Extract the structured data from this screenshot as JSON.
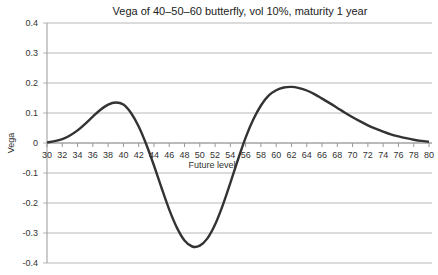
{
  "chart_data": {
    "type": "line",
    "title": "Vega of 40–50–60 butterfly, vol 10%, maturity 1 year",
    "xlabel": "Future level",
    "ylabel": "Vega",
    "xlim": [
      30,
      80
    ],
    "ylim": [
      -0.4,
      0.4
    ],
    "grid": true,
    "legend": "none",
    "x_ticks": [
      30,
      32,
      34,
      36,
      38,
      40,
      42,
      44,
      46,
      48,
      50,
      52,
      54,
      56,
      58,
      60,
      62,
      64,
      66,
      68,
      70,
      72,
      74,
      76,
      78,
      80
    ],
    "y_ticks": [
      0.4,
      0.3,
      0.2,
      0.1,
      0,
      -0.1,
      -0.2,
      -0.3,
      -0.4
    ],
    "y_tick_labels": [
      "0.4",
      "0.3",
      "0.2",
      "0.1",
      "0",
      "-0.1",
      "-0.2",
      "-0.3",
      "-0.4"
    ],
    "series": [
      {
        "name": "Vega",
        "color": "#333333",
        "x": [
          30,
          31,
          32,
          33,
          34,
          35,
          36,
          37,
          38,
          39,
          40,
          41,
          42,
          43,
          44,
          45,
          46,
          47,
          48,
          49,
          50,
          51,
          52,
          53,
          54,
          55,
          56,
          57,
          58,
          59,
          60,
          61,
          62,
          63,
          64,
          65,
          66,
          67,
          68,
          69,
          70,
          71,
          72,
          73,
          74,
          75,
          76,
          77,
          78,
          79,
          80
        ],
        "values": [
          0.002,
          0.006,
          0.013,
          0.025,
          0.042,
          0.064,
          0.088,
          0.111,
          0.128,
          0.135,
          0.128,
          0.1,
          0.055,
          -0.005,
          -0.075,
          -0.15,
          -0.222,
          -0.282,
          -0.325,
          -0.345,
          -0.342,
          -0.318,
          -0.272,
          -0.208,
          -0.133,
          -0.055,
          0.018,
          0.078,
          0.125,
          0.158,
          0.176,
          0.185,
          0.187,
          0.183,
          0.175,
          0.163,
          0.148,
          0.133,
          0.117,
          0.101,
          0.086,
          0.072,
          0.059,
          0.048,
          0.038,
          0.029,
          0.022,
          0.016,
          0.011,
          0.007,
          0.004
        ]
      }
    ]
  }
}
